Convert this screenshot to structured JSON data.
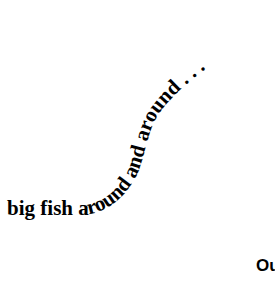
{
  "curved_text": {
    "full": "big fish around and around . . .",
    "color": "#000000"
  },
  "corner_text": {
    "label": "Ou"
  }
}
